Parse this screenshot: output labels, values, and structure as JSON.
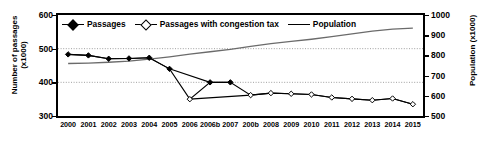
{
  "axes": {
    "y_left_label": "Number of passages (x1000)",
    "y_left_label_line1": "Number of passages",
    "y_left_label_line2": "(x1000)",
    "y_right_label": "Population  (x1000)",
    "y_left_ticks": [
      "600",
      "500",
      "400",
      "300"
    ],
    "y_right_ticks": [
      "1000",
      "900",
      "800",
      "700",
      "600",
      "500"
    ]
  },
  "legend": {
    "items": [
      {
        "label": "Passages",
        "marker": "filled-diamond-line",
        "color": "#000000"
      },
      {
        "label": "Passages with congestion tax",
        "marker": "open-diamond-line",
        "color": "#000000"
      },
      {
        "label": "Population",
        "marker": "plain-line",
        "color": "#555555"
      }
    ]
  },
  "chart_data": {
    "type": "line",
    "title": "",
    "xlabel": "",
    "ylabel": "Number of passages (x1000)",
    "y2label": "Population (x1000)",
    "grid": true,
    "gridlines_left": [
      500,
      400
    ],
    "legend_position": "top-inside",
    "ylim": [
      300,
      600
    ],
    "y2lim": [
      500,
      1000
    ],
    "categories": [
      "2000",
      "2001",
      "2002",
      "2003",
      "2004",
      "2005",
      "2006",
      "2006b",
      "2007",
      "200b",
      "2008",
      "2009",
      "2010",
      "2011",
      "2012",
      "2013",
      "2014",
      "2015"
    ],
    "series": [
      {
        "name": "Passages",
        "axis": "left",
        "marker": "filled-diamond",
        "values": [
          483,
          480,
          470,
          471,
          473,
          440,
          null,
          400,
          400,
          null,
          null,
          null,
          null,
          null,
          null,
          null,
          null,
          null
        ]
      },
      {
        "name": "Passages with congestion tax",
        "axis": "left",
        "marker": "open-diamond",
        "values": [
          null,
          null,
          null,
          null,
          null,
          null,
          350,
          null,
          null,
          362,
          368,
          366,
          364,
          355,
          351,
          347,
          352,
          335
        ]
      },
      {
        "name": "Population",
        "axis": "right",
        "marker": "none",
        "values": [
          760,
          762,
          766,
          772,
          782,
          793,
          806,
          818,
          830,
          845,
          858,
          869,
          880,
          893,
          907,
          920,
          930,
          935
        ]
      }
    ]
  }
}
